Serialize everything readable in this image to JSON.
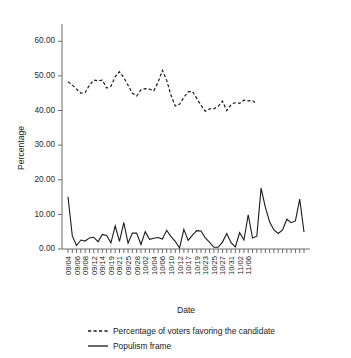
{
  "chart_data": {
    "type": "line",
    "title": "",
    "xlabel": "Date",
    "ylabel": "Percentage",
    "ylim": [
      0,
      65
    ],
    "yticks": [
      "0.00",
      "10.00",
      "20.00",
      "30.00",
      "40.00",
      "50.00",
      "60.00"
    ],
    "ytick_values": [
      0,
      10,
      20,
      30,
      40,
      50,
      60
    ],
    "grid": false,
    "legend_position": "below",
    "x_tick_count": 45,
    "categories": [
      "09/04",
      "09/05",
      "09/06",
      "09/07",
      "09/08",
      "09/11",
      "09/12",
      "09/13",
      "09/14",
      "09/18",
      "09/19",
      "09/20",
      "09/21",
      "09/24",
      "09/25",
      "09/26",
      "09/28",
      "10/01",
      "10/02",
      "10/03",
      "10/04",
      "10/05",
      "10/06",
      "10/09",
      "10/10",
      "10/11",
      "10/12",
      "10/16",
      "10/17",
      "10/18",
      "10/19",
      "10/22",
      "10/23",
      "10/24",
      "10/25",
      "10/26",
      "10/27",
      "10/30",
      "10/31",
      "11/01",
      "11/02",
      "11/05",
      "11/06",
      "11/07",
      "11/08"
    ],
    "xtick_labels_shown": [
      "09/04",
      "09/06",
      "09/08",
      "09/12",
      "09/14",
      "09/19",
      "09/21",
      "09/25",
      "09/28",
      "10/02",
      "10/04",
      "10/06",
      "10/10",
      "10/12",
      "10/17",
      "10/19",
      "10/23",
      "10/25",
      "10/27",
      "10/31",
      "11/02",
      "11/06"
    ],
    "series": [
      {
        "name": "Percentage of voters favoring the candidate",
        "style": "dashed",
        "color": "#1a1a1a",
        "values": [
          48.3,
          47.4,
          46.2,
          45.0,
          45.2,
          47.3,
          48.8,
          48.6,
          48.8,
          46.5,
          47.0,
          49.8,
          51.2,
          49.5,
          47.3,
          45.0,
          44.2,
          46.0,
          46.3,
          46.2,
          45.7,
          48.2,
          51.6,
          48.7,
          44.4,
          41.3,
          41.8,
          43.8,
          45.4,
          45.5,
          43.5,
          41.5,
          39.8,
          40.5,
          40.5,
          41.2,
          42.7,
          40.0,
          41.7,
          42.3,
          42.1,
          43.0,
          42.8,
          42.9,
          41.9
        ]
      },
      {
        "name": "Populism frame",
        "style": "solid",
        "color": "#1a1a1a",
        "values": [
          15.1,
          3.8,
          1.0,
          2.6,
          2.3,
          3.2,
          3.4,
          2.1,
          4.2,
          3.9,
          1.8,
          6.7,
          2.2,
          7.6,
          1.7,
          4.6,
          4.6,
          1.3,
          5.0,
          2.8,
          3.1,
          3.3,
          2.9,
          5.4,
          3.6,
          2.2,
          0.3,
          5.7,
          2.5,
          4.0,
          5.3,
          5.2,
          3.2,
          1.9,
          0.5,
          0.5,
          2.0,
          4.5,
          1.8,
          0.6,
          4.7,
          2.6,
          9.9,
          3.2,
          3.7
        ]
      }
    ],
    "series_extra_populism": [
      17.6,
      12.0,
      7.8,
      5.5,
      4.5,
      5.5,
      8.6,
      7.6,
      8.1,
      14.4,
      4.9
    ]
  },
  "legend": {
    "items": [
      {
        "label": "Percentage of voters favoring the candidate",
        "style": "dashed"
      },
      {
        "label": "Populism frame",
        "style": "solid"
      }
    ]
  },
  "axis": {
    "y_title": "Percentage",
    "x_title": "Date"
  }
}
